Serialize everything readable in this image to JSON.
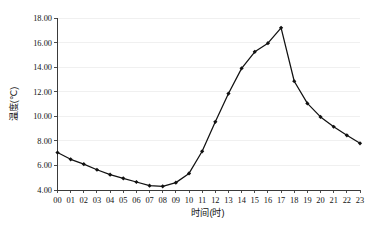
{
  "chart_data": {
    "type": "line",
    "title": "",
    "xlabel": "时间(时)",
    "ylabel": "温度(℃)",
    "categories": [
      "00",
      "01",
      "02",
      "03",
      "04",
      "05",
      "06",
      "07",
      "08",
      "09",
      "10",
      "11",
      "12",
      "13",
      "14",
      "15",
      "16",
      "17",
      "18",
      "19",
      "20",
      "21",
      "22",
      "23"
    ],
    "values": [
      7.05,
      6.5,
      6.1,
      5.65,
      5.25,
      4.95,
      4.65,
      4.35,
      4.3,
      4.6,
      5.35,
      7.15,
      9.55,
      11.85,
      13.9,
      15.25,
      15.95,
      17.2,
      12.85,
      11.05,
      9.95,
      9.15,
      8.45,
      7.8
    ],
    "series": [
      {
        "name": "温度",
        "values": [
          7.05,
          6.5,
          6.1,
          5.65,
          5.25,
          4.95,
          4.65,
          4.35,
          4.3,
          4.6,
          5.35,
          7.15,
          9.55,
          11.85,
          13.9,
          15.25,
          15.95,
          17.2,
          12.85,
          11.05,
          9.95,
          9.15,
          8.45,
          7.8
        ],
        "color": "#111111"
      }
    ],
    "ylim": [
      4.0,
      18.0
    ],
    "ytick_values": [
      4.0,
      6.0,
      8.0,
      10.0,
      12.0,
      14.0,
      16.0,
      18.0
    ],
    "ytick_labels": [
      "4.00",
      "6.00",
      "8.00",
      "10.00",
      "12.00",
      "14.00",
      "16.00",
      "18.00"
    ],
    "xtick_labels": [
      "00",
      "01",
      "02",
      "03",
      "04",
      "05",
      "06",
      "07",
      "08",
      "09",
      "10",
      "11",
      "12",
      "13",
      "14",
      "15",
      "16",
      "17",
      "18",
      "19",
      "20",
      "21",
      "22",
      "23"
    ],
    "grid": true,
    "grid_axis": "y",
    "legend": false,
    "legend_position": "none",
    "marker": "filled-diamond",
    "line_color": "#111111",
    "grid_color": "#ececec",
    "axis_color": "#3a3a3a",
    "background_color": "#ffffff"
  }
}
